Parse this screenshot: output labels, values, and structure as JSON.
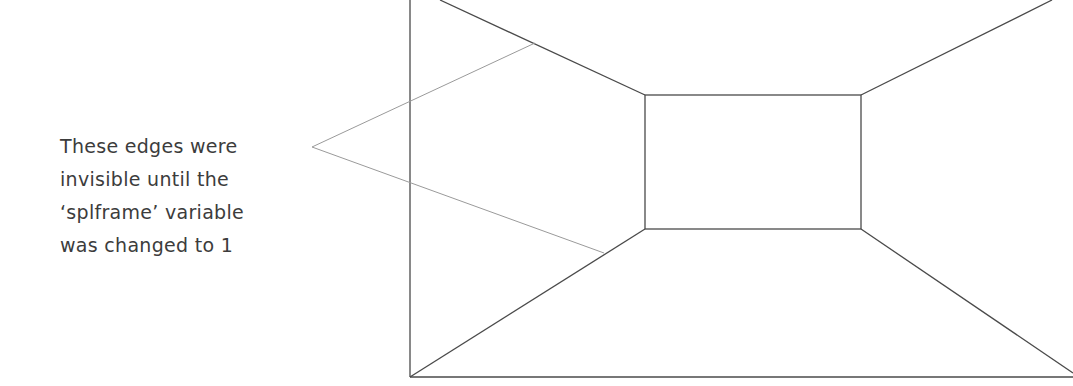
{
  "annotation": {
    "lines": [
      "These edges were",
      "invisible until the",
      "‘splframe’ variable",
      "was changed to 1"
    ]
  },
  "colors": {
    "edge": "#4a4a4a",
    "leader": "#9a9a9a",
    "text": "#3c3c3c",
    "background": "#ffffff"
  },
  "geometry": {
    "outer_frame": {
      "left": 410,
      "top": 0,
      "right": 1073,
      "bottom": 377
    },
    "inner_box": {
      "left": 645,
      "top": 95,
      "right": 861,
      "bottom": 229
    },
    "leader_apex": {
      "x": 312,
      "y": 147
    },
    "leader_targets": [
      {
        "x": 535,
        "y": 43
      },
      {
        "x": 604,
        "y": 253
      }
    ]
  }
}
